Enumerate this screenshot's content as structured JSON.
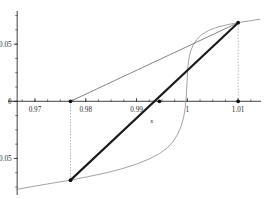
{
  "chart_data": {
    "type": "line",
    "title": "",
    "subtitle": "",
    "xlabel": "x",
    "ylabel": "",
    "grid": false,
    "legend": "none",
    "xlim": [
      0.9645,
      1.0145
    ],
    "ylim": [
      -0.082,
      0.079
    ],
    "x_ticks": [
      {
        "value": 0.97,
        "label": "0.97"
      },
      {
        "value": 0.98,
        "label": "0.98"
      },
      {
        "value": 0.99,
        "label": "0.99"
      },
      {
        "value": 1.0,
        "label": "1"
      },
      {
        "value": 1.01,
        "label": "1.01"
      }
    ],
    "y_ticks": [
      {
        "value": 0.05,
        "label": "0.05"
      },
      {
        "value": 0.0,
        "label": "0"
      },
      {
        "value": -0.05,
        "label": "-0.05"
      }
    ],
    "x_minor_tick_step": 0.0025,
    "y_minor_tick_step": 0.0125,
    "series": [
      {
        "name": "function-curve",
        "type": "line",
        "style": "thin-gray",
        "color": "#8c8c8c",
        "points": [
          [
            0.9663,
            -0.0772
          ],
          [
            0.97,
            -0.0742
          ],
          [
            0.974,
            -0.0712
          ],
          [
            0.977,
            -0.069
          ],
          [
            0.98,
            -0.0664
          ],
          [
            0.984,
            -0.0626
          ],
          [
            0.987,
            -0.0592
          ],
          [
            0.99,
            -0.055
          ],
          [
            0.9925,
            -0.0505
          ],
          [
            0.9945,
            -0.0458
          ],
          [
            0.996,
            -0.041
          ],
          [
            0.9972,
            -0.0352
          ],
          [
            0.9981,
            -0.0288
          ],
          [
            0.9988,
            -0.0215
          ],
          [
            0.9993,
            -0.0135
          ],
          [
            0.9996,
            -0.0052
          ],
          [
            0.9998,
            0.004
          ],
          [
            0.9999,
            0.0132
          ],
          [
            1.0,
            0.0222
          ],
          [
            1.0001,
            0.03
          ],
          [
            1.0003,
            0.037
          ],
          [
            1.0006,
            0.0432
          ],
          [
            1.0011,
            0.0488
          ],
          [
            1.0018,
            0.0538
          ],
          [
            1.0028,
            0.0582
          ],
          [
            1.0042,
            0.062
          ],
          [
            1.006,
            0.065
          ],
          [
            1.0082,
            0.0673
          ],
          [
            1.01,
            0.0688
          ],
          [
            1.012,
            0.0702
          ],
          [
            1.0143,
            0.0718
          ]
        ]
      },
      {
        "name": "secant-line-upper",
        "type": "line",
        "style": "thin-gray",
        "color": "#6e6e6e",
        "points": [
          [
            0.977,
            0.0
          ],
          [
            1.01,
            0.0688
          ]
        ]
      },
      {
        "name": "secant-chord-thick",
        "type": "line",
        "style": "thick-black",
        "color": "#1a1a1a",
        "points": [
          [
            0.977,
            -0.069
          ],
          [
            1.01,
            0.0688
          ]
        ]
      }
    ],
    "markers": [
      {
        "name": "root-bracket-left-on-axis",
        "x": 0.977,
        "y": 0.0
      },
      {
        "name": "curve-point-lower-left",
        "x": 0.977,
        "y": -0.069
      },
      {
        "name": "chord-axis-crossing",
        "x": 0.9945,
        "y": 0.0
      },
      {
        "name": "convergence-point",
        "x": 1.01,
        "y": 0.0688
      },
      {
        "name": "root-bracket-right-on-axis",
        "x": 1.01,
        "y": 0.0
      }
    ],
    "dotted_verticals": [
      {
        "name": "dotted-vertical-left",
        "x": 0.977,
        "y_from": 0.0,
        "y_to": -0.069
      },
      {
        "name": "dotted-vertical-right",
        "x": 1.01,
        "y_from": 0.0688,
        "y_to": 0.0
      }
    ],
    "colors": {
      "axis": "#2b2b2b",
      "curve": "#8c8c8c",
      "secant": "#6e6e6e",
      "chord": "#1a1a1a",
      "marker": "#111111",
      "dotted": "#8f8f8f",
      "background": "#ffffff"
    }
  },
  "axis": {
    "x_label": "x",
    "x_tick_labels": [
      "0.97",
      "0.98",
      "0.99",
      "1",
      "1.01"
    ],
    "y_tick_labels": [
      "0.05",
      "0",
      "-0.05"
    ]
  }
}
